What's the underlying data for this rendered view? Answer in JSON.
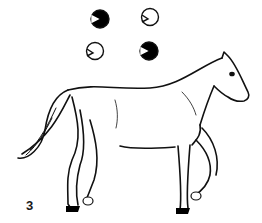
{
  "figure": {
    "frame_number": "3",
    "colors": {
      "line": "#111111",
      "background": "#ffffff",
      "hoof_fill": "#000000"
    }
  },
  "footfall_indicators": [
    {
      "position": "left-fore",
      "state": "grounded",
      "fill": "#000000"
    },
    {
      "position": "right-fore",
      "state": "lifted",
      "fill": "#ffffff"
    },
    {
      "position": "left-hind",
      "state": "lifted",
      "fill": "#ffffff"
    },
    {
      "position": "right-hind",
      "state": "grounded",
      "fill": "#000000"
    }
  ]
}
